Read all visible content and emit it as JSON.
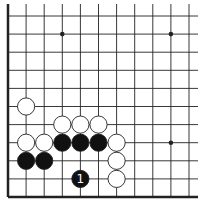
{
  "diagram": {
    "type": "go-board-diagram",
    "visible_columns": 11,
    "visible_rows": 11,
    "edges_shown": [
      "left",
      "bottom"
    ],
    "colors": {
      "background": "#ffffff",
      "line": "#222222",
      "black_stone": "#111111",
      "white_stone": "#ffffff",
      "label_on_black": "#ffffff"
    },
    "star_points": [
      {
        "col": 3,
        "row": 1
      },
      {
        "col": 9,
        "row": 1
      },
      {
        "col": 9,
        "row": 7
      }
    ],
    "stones": [
      {
        "color": "white",
        "col": 1,
        "row": 5,
        "label": ""
      },
      {
        "color": "white",
        "col": 3,
        "row": 6,
        "label": ""
      },
      {
        "color": "white",
        "col": 4,
        "row": 6,
        "label": ""
      },
      {
        "color": "white",
        "col": 5,
        "row": 6,
        "label": ""
      },
      {
        "color": "white",
        "col": 1,
        "row": 7,
        "label": ""
      },
      {
        "color": "white",
        "col": 2,
        "row": 7,
        "label": ""
      },
      {
        "color": "black",
        "col": 3,
        "row": 7,
        "label": ""
      },
      {
        "color": "black",
        "col": 4,
        "row": 7,
        "label": ""
      },
      {
        "color": "black",
        "col": 5,
        "row": 7,
        "label": ""
      },
      {
        "color": "white",
        "col": 6,
        "row": 7,
        "label": ""
      },
      {
        "color": "black",
        "col": 1,
        "row": 8,
        "label": ""
      },
      {
        "color": "black",
        "col": 2,
        "row": 8,
        "label": ""
      },
      {
        "color": "white",
        "col": 6,
        "row": 8,
        "label": ""
      },
      {
        "color": "black",
        "col": 4,
        "row": 9,
        "label": "1"
      },
      {
        "color": "white",
        "col": 6,
        "row": 9,
        "label": ""
      }
    ]
  }
}
